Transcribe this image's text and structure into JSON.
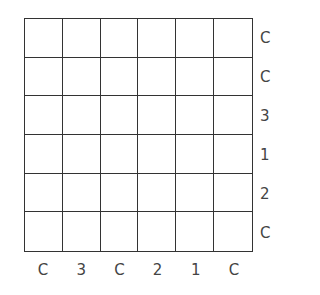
{
  "puzzle": {
    "rows": 6,
    "cols": 6,
    "right_clues": [
      "C",
      "C",
      "3",
      "1",
      "2",
      "C"
    ],
    "bottom_clues": [
      "C",
      "3",
      "C",
      "2",
      "1",
      "C"
    ],
    "cells": [
      [
        "",
        "",
        "",
        "",
        "",
        ""
      ],
      [
        "",
        "",
        "",
        "",
        "",
        ""
      ],
      [
        "",
        "",
        "",
        "",
        "",
        ""
      ],
      [
        "",
        "",
        "",
        "",
        "",
        ""
      ],
      [
        "",
        "",
        "",
        "",
        "",
        ""
      ],
      [
        "",
        "",
        "",
        "",
        "",
        ""
      ]
    ]
  },
  "colors": {
    "grid_line": "#333333",
    "clue_text": "#444444",
    "background": "#ffffff"
  }
}
